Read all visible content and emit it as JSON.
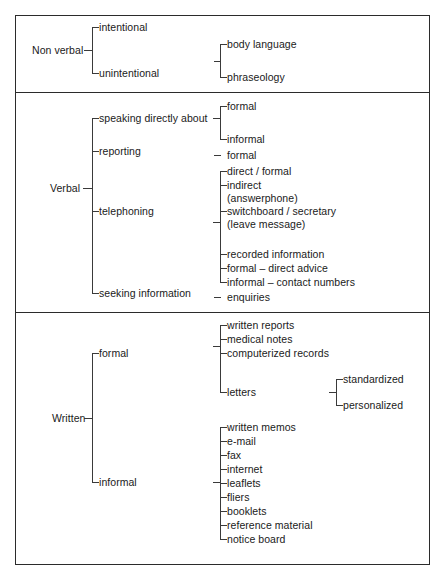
{
  "diagram": {
    "line_color": "#3a3a3a",
    "frame_color": "#2b2b2b",
    "background": "#ffffff",
    "sections": [
      {
        "id": "non-verbal",
        "root": "Non verbal",
        "branches": [
          {
            "label": "intentional",
            "children": []
          },
          {
            "label": "unintentional",
            "children": [
              "body language",
              "phraseology"
            ]
          }
        ]
      },
      {
        "id": "verbal",
        "root": "Verbal",
        "branches": [
          {
            "label": "speaking directly about",
            "children": [
              "formal",
              "informal"
            ]
          },
          {
            "label": "reporting",
            "children": [
              "formal"
            ]
          },
          {
            "label": "telephoning",
            "children": [
              "direct / formal",
              "indirect",
              "(answerphone)",
              "switchboard / secretary",
              "(leave message)",
              "recorded information",
              "formal – direct advice",
              "informal – contact numbers"
            ]
          },
          {
            "label": "seeking information",
            "children": [
              "enquiries"
            ]
          }
        ]
      },
      {
        "id": "written",
        "root": "Written",
        "branches": [
          {
            "label": "formal",
            "children": [
              "written reports",
              "medical notes",
              "computerized records",
              "letters"
            ],
            "grandchildren": [
              "standardized",
              "personalized"
            ]
          },
          {
            "label": "informal",
            "children": [
              "written memos",
              "e-mail",
              "fax",
              "internet",
              "leaflets",
              "fliers",
              "booklets",
              "reference material",
              "notice board"
            ]
          }
        ]
      }
    ]
  }
}
